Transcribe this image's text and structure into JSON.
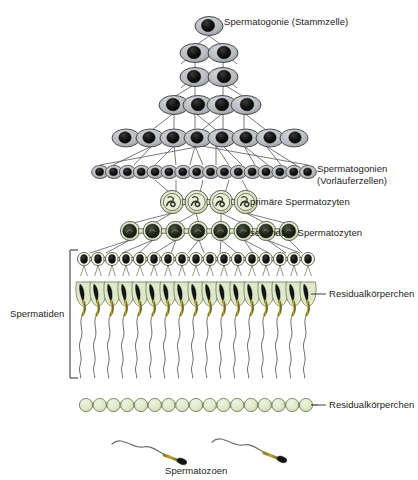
{
  "figure": {
    "language": "de",
    "background_color": "#ffffff"
  },
  "labels": {
    "stem_cell": "Spermatogonie (Stammzelle)",
    "precursor_cells": "Spermatogonien\n(Vorläuferzellen)",
    "primary_spermatocytes": "primäre Spermatozyten",
    "secondary_spermatocytes": "sekundäre Spermatozyten",
    "residual_bodies_upper": "Residualkörperchen",
    "residual_bodies_lower": "Residualkörperchen",
    "spermatids": "Spermatiden",
    "spermatozoa": "Spermatozoen"
  },
  "colors": {
    "spermatogonium_cytoplasm": "#b9bcc0",
    "spermatogonium_nucleus": "#111111",
    "spermatocyte_cytoplasm": "#dfe6cf",
    "spermatocyte_nucleus": "#3f4a33",
    "residual_body": "#dde7c8",
    "residual_body_outline": "#6f7a52",
    "sperm_head": "#1a1a1a",
    "sperm_midpiece": "#9a8b2e",
    "sperm_tail": "#6e6e66",
    "outline": "#3a3a3a",
    "text": "#1c1c1c"
  },
  "stages": [
    {
      "id": "stem-cell",
      "name": "Spermatogonie (Stammzelle)",
      "cell_count": 1,
      "cell_type": "spermatogonium",
      "row_y": 24
    },
    {
      "id": "spermatogonia-2",
      "name": "Spermatogonien",
      "cell_count": 2,
      "cell_type": "spermatogonium",
      "row_y": 51
    },
    {
      "id": "spermatogonia-2b",
      "name": "Spermatogonien",
      "cell_count": 2,
      "cell_type": "spermatogonium",
      "row_y": 75
    },
    {
      "id": "spermatogonia-4",
      "name": "Spermatogonien",
      "cell_count": 4,
      "cell_type": "spermatogonium",
      "row_y": 104
    },
    {
      "id": "spermatogonia-8",
      "name": "Spermatogonien",
      "cell_count": 8,
      "cell_type": "spermatogonium",
      "row_y": 137
    },
    {
      "id": "spermatogonia-16",
      "name": "Spermatogonien (Vorläuferzellen)",
      "cell_count": 16,
      "cell_type": "spermatogonium",
      "row_y": 172
    },
    {
      "id": "primary-spermatocytes",
      "name": "primäre Spermatozyten",
      "cell_count": 4,
      "cell_type": "primary-spermatocyte",
      "row_y": 202
    },
    {
      "id": "secondary-spermatocytes",
      "name": "sekundäre Spermatozyten",
      "cell_count": 8,
      "cell_type": "secondary-spermatocyte",
      "row_y": 231
    },
    {
      "id": "round-spermatids",
      "name": "Spermatiden",
      "cell_count": 17,
      "cell_type": "round-spermatid",
      "row_y": 259
    },
    {
      "id": "residual-bodies-attached",
      "name": "Residualkörperchen",
      "cell_count": 17,
      "cell_type": "residual-body",
      "row_y": 294
    },
    {
      "id": "elongating-spermatids",
      "name": "Spermatiden",
      "cell_count": 17,
      "cell_type": "elongating-spermatid",
      "row_y": 300
    },
    {
      "id": "residual-bodies-free",
      "name": "Residualkörperchen",
      "cell_count": 17,
      "cell_type": "residual-body",
      "row_y": 405
    },
    {
      "id": "spermatozoa",
      "name": "Spermatozoen",
      "cell_count": 2,
      "cell_type": "spermatozoon",
      "row_y": 450
    }
  ]
}
